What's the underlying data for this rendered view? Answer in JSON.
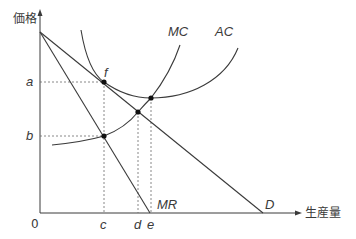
{
  "axes": {
    "y_label": "価格",
    "x_label": "生産量",
    "origin_label": "0"
  },
  "price_labels": {
    "a": "a",
    "b": "b"
  },
  "quantity_labels": {
    "c": "c",
    "d": "d",
    "e": "e"
  },
  "curves": {
    "mc": "MC",
    "ac": "AC",
    "mr": "MR",
    "d": "D"
  },
  "points": {
    "f": "f"
  },
  "colors": {
    "line": "#3a3a3a",
    "dashed": "#6a6a6a",
    "background": "#ffffff"
  }
}
